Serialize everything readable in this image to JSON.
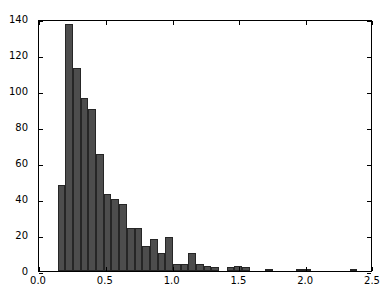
{
  "figure": {
    "width": 392,
    "height": 298,
    "background": "#ffffff",
    "bar_color": "#4d4d4d",
    "bar_edge_color": "#262626",
    "axis_color": "#000000"
  },
  "chart_data": {
    "type": "bar",
    "title": "",
    "xlabel": "",
    "ylabel": "",
    "xlim": [
      0.0,
      2.5
    ],
    "ylim": [
      0,
      140
    ],
    "grid": false,
    "legend": null,
    "xticks": [
      "0.0",
      "0.5",
      "1.0",
      "1.5",
      "2.0",
      "2.5"
    ],
    "xtick_values": [
      0.0,
      0.5,
      1.0,
      1.5,
      2.0,
      2.5
    ],
    "yticks": [
      "0",
      "20",
      "40",
      "60",
      "80",
      "100",
      "120",
      "140"
    ],
    "ytick_values": [
      0,
      20,
      40,
      60,
      80,
      100,
      120,
      140
    ],
    "bin_width": 0.0575,
    "bin_starts": [
      0.14,
      0.1975,
      0.255,
      0.3125,
      0.37,
      0.4275,
      0.485,
      0.5425,
      0.6,
      0.6575,
      0.715,
      0.7725,
      0.83,
      0.8875,
      0.945,
      1.0025,
      1.06,
      1.1175,
      1.175,
      1.2325,
      1.29,
      1.3475,
      1.405,
      1.4625,
      1.52,
      1.5775,
      1.635,
      1.6925,
      1.75,
      1.8075,
      1.865,
      1.9225,
      1.98,
      2.0375,
      2.095,
      2.1525,
      2.21,
      2.2675,
      2.325,
      2.3825
    ],
    "values": [
      48,
      137,
      113,
      96,
      90,
      65,
      43,
      40,
      37,
      24,
      24,
      14,
      18,
      10,
      19,
      4,
      4,
      10,
      4,
      3,
      2,
      0,
      2,
      3,
      2,
      0,
      0,
      1,
      0,
      0,
      0,
      1,
      1,
      0,
      0,
      0,
      0,
      0,
      1,
      0
    ],
    "categories": [
      "0.14",
      "0.20",
      "0.26",
      "0.31",
      "0.37",
      "0.43",
      "0.49",
      "0.54",
      "0.60",
      "0.66",
      "0.72",
      "0.77",
      "0.83",
      "0.89",
      "0.95",
      "1.00",
      "1.06",
      "1.12",
      "1.18",
      "1.23",
      "1.29",
      "1.35",
      "1.41",
      "1.46",
      "1.52",
      "1.58",
      "1.64",
      "1.69",
      "1.75",
      "1.81",
      "1.87",
      "1.92",
      "1.98",
      "2.04",
      "2.10",
      "2.15",
      "2.21",
      "2.27",
      "2.33",
      "2.38"
    ]
  }
}
